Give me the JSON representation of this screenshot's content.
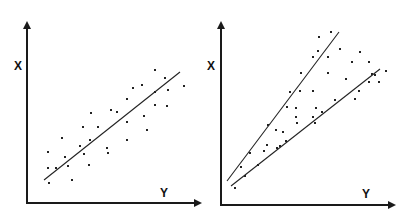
{
  "chart_data": [
    {
      "type": "scatter",
      "title": "",
      "xlabel": "Y",
      "ylabel": "X",
      "grid": false,
      "legend": null,
      "description": "Linear positive correlation with single regression line (homoscedastic)",
      "points_px": [
        [
          48,
          152
        ],
        [
          48,
          168
        ],
        [
          49,
          183
        ],
        [
          56,
          168
        ],
        [
          62,
          138
        ],
        [
          65,
          157
        ],
        [
          68,
          166
        ],
        [
          72,
          180
        ],
        [
          80,
          146
        ],
        [
          83,
          127
        ],
        [
          90,
          140
        ],
        [
          91,
          113
        ],
        [
          84,
          154
        ],
        [
          89,
          165
        ],
        [
          98,
          127
        ],
        [
          107,
          148
        ],
        [
          108,
          153
        ],
        [
          111,
          110
        ],
        [
          117,
          112
        ],
        [
          127,
          99
        ],
        [
          127,
          122
        ],
        [
          133,
          88
        ],
        [
          127,
          140
        ],
        [
          144,
          116
        ],
        [
          147,
          130
        ],
        [
          155,
          70
        ],
        [
          155,
          92
        ],
        [
          155,
          105
        ],
        [
          165,
          78
        ],
        [
          168,
          90
        ],
        [
          167,
          106
        ],
        [
          184,
          86
        ],
        [
          142,
          85
        ]
      ],
      "fit_lines_px": [
        [
          [
            44,
            180
          ],
          [
            180,
            72
          ]
        ]
      ],
      "axes_px": {
        "origin": [
          27,
          203
        ],
        "y_top": [
          27,
          20
        ],
        "x_right": [
          203,
          203
        ]
      }
    },
    {
      "type": "scatter",
      "title": "",
      "xlabel": "Y",
      "ylabel": "X",
      "grid": false,
      "legend": null,
      "description": "Heteroscedastic data; spread widens with Y, bounded by two diverging lines",
      "points_px": [
        [
          235,
          188
        ],
        [
          241,
          167
        ],
        [
          245,
          176
        ],
        [
          250,
          153
        ],
        [
          258,
          165
        ],
        [
          264,
          151
        ],
        [
          267,
          145
        ],
        [
          268,
          125
        ],
        [
          276,
          130
        ],
        [
          277,
          148
        ],
        [
          280,
          146
        ],
        [
          283,
          132
        ],
        [
          286,
          141
        ],
        [
          287,
          107
        ],
        [
          290,
          92
        ],
        [
          296,
          117
        ],
        [
          297,
          123
        ],
        [
          296,
          108
        ],
        [
          301,
          73
        ],
        [
          300,
          91
        ],
        [
          313,
          117
        ],
        [
          313,
          57
        ],
        [
          313,
          91
        ],
        [
          315,
          123
        ],
        [
          316,
          108
        ],
        [
          318,
          51
        ],
        [
          319,
          37
        ],
        [
          322,
          112
        ],
        [
          328,
          73
        ],
        [
          328,
          57
        ],
        [
          335,
          100
        ],
        [
          331,
          32
        ],
        [
          340,
          49
        ],
        [
          346,
          79
        ],
        [
          352,
          62
        ],
        [
          355,
          99
        ],
        [
          359,
          91
        ],
        [
          360,
          52
        ],
        [
          369,
          82
        ],
        [
          369,
          62
        ],
        [
          372,
          74
        ],
        [
          375,
          75
        ],
        [
          379,
          82
        ],
        [
          386,
          71
        ]
      ],
      "fit_lines_px": [
        [
          [
            227,
            181
          ],
          [
            339,
            32
          ]
        ],
        [
          [
            231,
            186
          ],
          [
            380,
            69
          ]
        ]
      ],
      "axes_px": {
        "origin": [
          221,
          205
        ],
        "y_top": [
          221,
          20
        ],
        "x_right": [
          396,
          205
        ]
      }
    }
  ],
  "panels": [
    {
      "x_label": "X",
      "y_label": "Y"
    },
    {
      "x_label": "X",
      "y_label": "Y"
    }
  ]
}
